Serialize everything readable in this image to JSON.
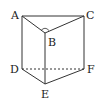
{
  "figure": {
    "type": "triangular-prism",
    "vertices": {
      "A": {
        "label": "A",
        "x": 22,
        "y": 16
      },
      "B": {
        "label": "B",
        "x": 45,
        "y": 33
      },
      "C": {
        "label": "C",
        "x": 84,
        "y": 16
      },
      "D": {
        "label": "D",
        "x": 22,
        "y": 69
      },
      "E": {
        "label": "E",
        "x": 45,
        "y": 84
      },
      "F": {
        "label": "F",
        "x": 84,
        "y": 69
      }
    },
    "solid_edges": [
      "AB",
      "BC",
      "AC",
      "AD",
      "BE",
      "CF",
      "DE",
      "EF"
    ],
    "dashed_edges": [
      "DF"
    ],
    "right_angle_mark": "B",
    "line_color": "#333333"
  }
}
